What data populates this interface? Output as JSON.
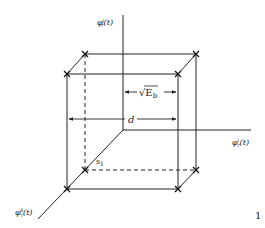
{
  "diagram": {
    "type": "3d-signal-constellation-cube",
    "axes": {
      "vertical": {
        "label_base": "φ",
        "label_sup": "j",
        "label_sub": "r",
        "label_arg": "(t)"
      },
      "horizontal": {
        "label_base": "φ",
        "label_sup": "i",
        "label_sub": "r",
        "label_arg": "(t)"
      },
      "depth": {
        "label_base": "φ",
        "label_sup": "k",
        "label_sub": "r",
        "label_arg": "(t)"
      }
    },
    "dimensions": {
      "half_side_label": "√E",
      "half_side_sub": "b",
      "side_label": "d"
    },
    "point_label": {
      "text": "s",
      "sub": "1"
    },
    "page_marker": "1",
    "colors": {
      "ink": "#222222",
      "background": "#ffffff"
    }
  }
}
